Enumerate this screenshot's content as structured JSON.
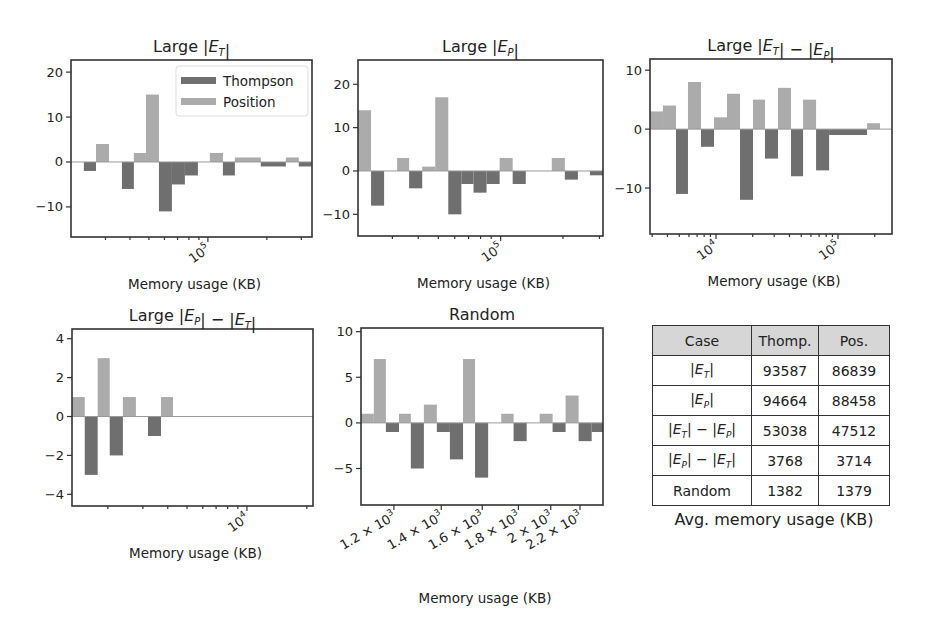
{
  "figure": {
    "legend": {
      "thompson": "Thompson",
      "position": "Position"
    },
    "colors": {
      "thompson": "#6f6f6f",
      "position": "#ababab",
      "zero_line": "#9a9a9a",
      "table_header": "#d6d6d6"
    }
  },
  "chart_data": [
    {
      "id": "large-et",
      "type": "bar",
      "title": "Large |E_T|",
      "xlabel": "Memory usage (KB)",
      "ylabel": "",
      "xscale": "log",
      "xlim": [
        20000,
        340000
      ],
      "ylim": [
        -16.7,
        22.7
      ],
      "yticks": [
        -10,
        0,
        10,
        20
      ],
      "xticks_major": [
        {
          "value": 100000,
          "label": "10^5"
        }
      ],
      "xticks_minor": [
        30000,
        40000,
        50000,
        60000,
        70000,
        80000,
        90000,
        200000,
        300000
      ],
      "legend": "top-right",
      "bars": [
        {
          "series": "Thompson",
          "x0": 23270,
          "x1": 26830,
          "value": -2
        },
        {
          "series": "Position",
          "x0": 26830,
          "x1": 31270,
          "value": 4
        },
        {
          "series": "Thompson",
          "x0": 36400,
          "x1": 41880,
          "value": -6
        },
        {
          "series": "Position",
          "x0": 41880,
          "x1": 48270,
          "value": 2
        },
        {
          "series": "Position",
          "x0": 48270,
          "x1": 56240,
          "value": 15
        },
        {
          "series": "Thompson",
          "x0": 56240,
          "x1": 65500,
          "value": -11
        },
        {
          "series": "Thompson",
          "x0": 65500,
          "x1": 76300,
          "value": -5
        },
        {
          "series": "Thompson",
          "x0": 76300,
          "x1": 88900,
          "value": -3
        },
        {
          "series": "Position",
          "x0": 102400,
          "x1": 119300,
          "value": 2
        },
        {
          "series": "Thompson",
          "x0": 119300,
          "x1": 137300,
          "value": -3
        },
        {
          "series": "Position",
          "x0": 137300,
          "x1": 186300,
          "value": 1
        },
        {
          "series": "Thompson",
          "x0": 186300,
          "x1": 250000,
          "value": -1
        },
        {
          "series": "Position",
          "x0": 250000,
          "x1": 291000,
          "value": 1
        },
        {
          "series": "Thompson",
          "x0": 291000,
          "x1": 339000,
          "value": -1
        }
      ]
    },
    {
      "id": "large-ep",
      "type": "bar",
      "title": "Large |E_P|",
      "xlabel": "Memory usage (KB)",
      "ylabel": "",
      "xscale": "log",
      "xlim": [
        20470,
        312100
      ],
      "ylim": [
        -15.0,
        25.6
      ],
      "yticks": [
        -10,
        0,
        10,
        20
      ],
      "xticks_major": [
        {
          "value": 100000,
          "label": "10^5"
        }
      ],
      "xticks_minor": [
        30000,
        40000,
        50000,
        60000,
        70000,
        80000,
        90000,
        200000,
        300000
      ],
      "bars": [
        {
          "series": "Position",
          "x0": 20470,
          "x1": 23670,
          "value": 14
        },
        {
          "series": "Thompson",
          "x0": 23670,
          "x1": 27360,
          "value": -8
        },
        {
          "series": "Position",
          "x0": 31630,
          "x1": 36140,
          "value": 3
        },
        {
          "series": "Thompson",
          "x0": 36140,
          "x1": 41800,
          "value": -4
        },
        {
          "series": "Position",
          "x0": 41800,
          "x1": 48310,
          "value": 1
        },
        {
          "series": "Position",
          "x0": 48310,
          "x1": 55860,
          "value": 17
        },
        {
          "series": "Thompson",
          "x0": 55860,
          "x1": 64600,
          "value": -10
        },
        {
          "series": "Thompson",
          "x0": 64600,
          "x1": 73950,
          "value": -3
        },
        {
          "series": "Thompson",
          "x0": 73950,
          "x1": 85490,
          "value": -5
        },
        {
          "series": "Thompson",
          "x0": 85490,
          "x1": 98900,
          "value": -3
        },
        {
          "series": "Position",
          "x0": 98900,
          "x1": 114300,
          "value": 3
        },
        {
          "series": "Thompson",
          "x0": 114300,
          "x1": 132200,
          "value": -3
        },
        {
          "series": "Position",
          "x0": 176600,
          "x1": 204200,
          "value": 3
        },
        {
          "series": "Thompson",
          "x0": 204200,
          "x1": 236100,
          "value": -2
        },
        {
          "series": "Thompson",
          "x0": 270000,
          "x1": 312100,
          "value": -1
        }
      ]
    },
    {
      "id": "large-et-minus-ep",
      "type": "bar",
      "title": "Large |E_T| − |E_P|",
      "xlabel": "Memory usage (KB)",
      "ylabel": "",
      "xscale": "log",
      "xlim": [
        2878,
        277000
      ],
      "ylim": [
        -17.8,
        11.9
      ],
      "yticks": [
        -10,
        0,
        10
      ],
      "xticks_major": [
        {
          "value": 10000,
          "label": "10^4"
        },
        {
          "value": 100000,
          "label": "10^5"
        }
      ],
      "xticks_minor": [
        3000,
        4000,
        5000,
        6000,
        7000,
        8000,
        9000,
        20000,
        30000,
        40000,
        50000,
        60000,
        70000,
        80000,
        90000,
        200000
      ],
      "bars": [
        {
          "series": "Position",
          "x0": 2878,
          "x1": 3674,
          "value": 3
        },
        {
          "series": "Position",
          "x0": 3674,
          "x1": 4699,
          "value": 4
        },
        {
          "series": "Thompson",
          "x0": 4699,
          "x1": 5892,
          "value": -11
        },
        {
          "series": "Position",
          "x0": 5892,
          "x1": 7532,
          "value": 8
        },
        {
          "series": "Thompson",
          "x0": 7532,
          "x1": 9630,
          "value": -3
        },
        {
          "series": "Position",
          "x0": 9630,
          "x1": 12310,
          "value": 2
        },
        {
          "series": "Position",
          "x0": 12310,
          "x1": 15740,
          "value": 6
        },
        {
          "series": "Thompson",
          "x0": 15740,
          "x1": 20100,
          "value": -12
        },
        {
          "series": "Position",
          "x0": 20100,
          "x1": 25200,
          "value": 5
        },
        {
          "series": "Thompson",
          "x0": 25200,
          "x1": 32200,
          "value": -5
        },
        {
          "series": "Position",
          "x0": 32200,
          "x1": 41200,
          "value": 7
        },
        {
          "series": "Thompson",
          "x0": 41200,
          "x1": 51700,
          "value": -8
        },
        {
          "series": "Position",
          "x0": 51700,
          "x1": 66100,
          "value": 5
        },
        {
          "series": "Thompson",
          "x0": 66100,
          "x1": 84500,
          "value": -7
        },
        {
          "series": "Thompson",
          "x0": 84500,
          "x1": 173000,
          "value": -1
        },
        {
          "series": "Position",
          "x0": 173000,
          "x1": 221000,
          "value": 1
        }
      ]
    },
    {
      "id": "large-ep-minus-et",
      "type": "bar",
      "title": "Large |E_P| − |E_T|",
      "xlabel": "Memory usage (KB)",
      "ylabel": "",
      "xscale": "log",
      "xlim": [
        1321,
        21480
      ],
      "ylim": [
        -4.6,
        4.5
      ],
      "yticks": [
        -4,
        -2,
        0,
        2,
        4
      ],
      "xticks_major": [
        {
          "value": 10000,
          "label": "10^4"
        }
      ],
      "xticks_minor": [
        2000,
        3000,
        4000,
        5000,
        6000,
        7000,
        8000,
        9000,
        20000
      ],
      "bars": [
        {
          "series": "Position",
          "x0": 1321,
          "x1": 1531,
          "value": 1
        },
        {
          "series": "Thompson",
          "x0": 1531,
          "x1": 1778,
          "value": -3
        },
        {
          "series": "Position",
          "x0": 1778,
          "x1": 2044,
          "value": 3
        },
        {
          "series": "Thompson",
          "x0": 2044,
          "x1": 2380,
          "value": -2
        },
        {
          "series": "Position",
          "x0": 2380,
          "x1": 2767,
          "value": 1
        },
        {
          "series": "Thompson",
          "x0": 3183,
          "x1": 3700,
          "value": -1
        },
        {
          "series": "Position",
          "x0": 3700,
          "x1": 4250,
          "value": 1
        }
      ]
    },
    {
      "id": "random",
      "type": "bar",
      "title": "Random",
      "xlabel": "Memory usage (KB)",
      "ylabel": "",
      "xscale": "log",
      "xlim": [
        1078,
        2371
      ],
      "ylim": [
        -9.0,
        10.4
      ],
      "yticks": [
        -5,
        0,
        5,
        10
      ],
      "xticks_major": [
        {
          "value": 1200,
          "label": "1.2 × 10^3"
        },
        {
          "value": 1400,
          "label": "1.4 × 10^3"
        },
        {
          "value": 1600,
          "label": "1.6 × 10^3"
        },
        {
          "value": 1800,
          "label": "1.8 × 10^3"
        },
        {
          "value": 2000,
          "label": "2 × 10^3"
        },
        {
          "value": 2200,
          "label": "2.2 × 10^3"
        }
      ],
      "xticks_minor": [],
      "bars": [
        {
          "series": "Position",
          "x0": 1078,
          "x1": 1124,
          "value": 1
        },
        {
          "series": "Position",
          "x0": 1124,
          "x1": 1169,
          "value": 7
        },
        {
          "series": "Thompson",
          "x0": 1169,
          "x1": 1220,
          "value": -1
        },
        {
          "series": "Position",
          "x0": 1220,
          "x1": 1268,
          "value": 1
        },
        {
          "series": "Thompson",
          "x0": 1268,
          "x1": 1323,
          "value": -5
        },
        {
          "series": "Position",
          "x0": 1323,
          "x1": 1380,
          "value": 2
        },
        {
          "series": "Thompson",
          "x0": 1380,
          "x1": 1440,
          "value": -1
        },
        {
          "series": "Thompson",
          "x0": 1440,
          "x1": 1503,
          "value": -4
        },
        {
          "series": "Position",
          "x0": 1503,
          "x1": 1563,
          "value": 7
        },
        {
          "series": "Thompson",
          "x0": 1563,
          "x1": 1631,
          "value": -6
        },
        {
          "series": "Position",
          "x0": 1702,
          "x1": 1772,
          "value": 1
        },
        {
          "series": "Thompson",
          "x0": 1772,
          "x1": 1849,
          "value": -2
        },
        {
          "series": "Position",
          "x0": 1929,
          "x1": 2012,
          "value": 1
        },
        {
          "series": "Thompson",
          "x0": 2012,
          "x1": 2099,
          "value": -1
        },
        {
          "series": "Position",
          "x0": 2099,
          "x1": 2190,
          "value": 3
        },
        {
          "series": "Thompson",
          "x0": 2190,
          "x1": 2285,
          "value": -2
        },
        {
          "series": "Thompson",
          "x0": 2285,
          "x1": 2371,
          "value": -1
        }
      ]
    },
    {
      "id": "avg-memory-table",
      "type": "table",
      "caption": "Avg. memory usage (KB)",
      "columns": [
        "Case",
        "Thomp.",
        "Pos."
      ],
      "rows": [
        {
          "case": "|E_T|",
          "thompson": 93587,
          "position": 86839
        },
        {
          "case": "|E_P|",
          "thompson": 94664,
          "position": 88458
        },
        {
          "case": "|E_T| − |E_P|",
          "thompson": 53038,
          "position": 47512
        },
        {
          "case": "|E_P| − |E_T|",
          "thompson": 3768,
          "position": 3714
        },
        {
          "case": "Random",
          "thompson": 1382,
          "position": 1379
        }
      ]
    }
  ]
}
